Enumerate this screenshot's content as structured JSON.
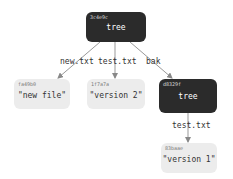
{
  "diagram": {
    "nodes": [
      {
        "id": "root",
        "hash": "3c4e9c",
        "label": "tree",
        "kind": "tree"
      },
      {
        "id": "newfile",
        "hash": "fa49b0",
        "label": "\"new file\"",
        "kind": "blob"
      },
      {
        "id": "v2",
        "hash": "1f7a7a",
        "label": "\"version 2\"",
        "kind": "blob"
      },
      {
        "id": "bak",
        "hash": "d8329f",
        "label": "tree",
        "kind": "tree"
      },
      {
        "id": "v1",
        "hash": "83baae",
        "label": "\"version 1\"",
        "kind": "blob"
      }
    ],
    "edges": [
      {
        "from": "root",
        "to": "newfile",
        "label": "new.txt"
      },
      {
        "from": "root",
        "to": "v2",
        "label": "test.txt"
      },
      {
        "from": "root",
        "to": "bak",
        "label": "bak"
      },
      {
        "from": "bak",
        "to": "v1",
        "label": "test.txt"
      }
    ],
    "colors": {
      "tree": "#2b2b2b",
      "blob": "#ececec",
      "edge": "#888888"
    }
  }
}
